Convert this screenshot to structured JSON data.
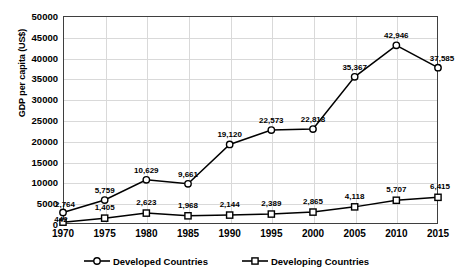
{
  "chart_data": {
    "type": "line",
    "title": "",
    "xlabel": "",
    "ylabel": "GDP per capita (US$)",
    "x": [
      1970,
      1975,
      1980,
      1985,
      1990,
      1995,
      2000,
      2005,
      2010,
      2015
    ],
    "categories": [
      "1970",
      "1975",
      "1980",
      "1985",
      "1990",
      "1995",
      "2000",
      "2005",
      "2010",
      "2015"
    ],
    "xlim": [
      1970,
      2015
    ],
    "ylim": [
      0,
      50000
    ],
    "ytick_labels": [
      "0",
      "5000",
      "10000",
      "15000",
      "20000",
      "25000",
      "30000",
      "35000",
      "40000",
      "45000",
      "50000"
    ],
    "yticks": [
      0,
      5000,
      10000,
      15000,
      20000,
      25000,
      30000,
      35000,
      40000,
      45000,
      50000
    ],
    "grid": true,
    "legend_position": "bottom",
    "series": [
      {
        "name": "Developed Countries",
        "marker": "circle",
        "values": [
          2764,
          5759,
          10629,
          9661,
          19120,
          22573,
          22818,
          35367,
          42946,
          37585
        ],
        "labels": [
          "2,764",
          "5,759",
          "10,629",
          "9,661",
          "19,120",
          "22,573",
          "22,818",
          "35,367",
          "42,946",
          "37,585"
        ]
      },
      {
        "name": "Developing Countries",
        "marker": "square",
        "values": [
          442,
          1405,
          2623,
          1968,
          2144,
          2389,
          2865,
          4118,
          5707,
          6415
        ],
        "labels": [
          "442",
          "1,405",
          "2,623",
          "1,968",
          "2,144",
          "2,389",
          "2,865",
          "4,118",
          "5,707",
          "6,415"
        ]
      }
    ],
    "colors": {
      "line": "#000000",
      "marker_fill": "#ffffff",
      "grid": "#d9d9d9",
      "axis": "#3f3f3f"
    }
  }
}
